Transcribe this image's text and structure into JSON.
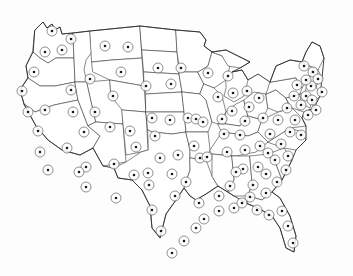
{
  "figure": {
    "kind": "map",
    "title": "",
    "region": "Contiguous United States",
    "projection_hint": "flat outline, state boundaries",
    "background_color": "#fdfdfd",
    "state_fill_color": "#ffffff",
    "state_border_color": "#3a3a3a",
    "nation_border_color": "#2a2a2a",
    "marker": {
      "name": "bullseye-marker",
      "ring_color": "#555555",
      "ring_fill": "#ffffff",
      "core_color": "#1a1a1a",
      "ring_radius_px": 5,
      "core_radius_px": 1.3,
      "count": 115
    },
    "markers": [
      {
        "label": "marker-1",
        "x": 52,
        "y": 31
      },
      {
        "label": "marker-2",
        "x": 45,
        "y": 52
      },
      {
        "label": "marker-3",
        "x": 71,
        "y": 39
      },
      {
        "label": "marker-4",
        "x": 62,
        "y": 50
      },
      {
        "label": "marker-5",
        "x": 34,
        "y": 72
      },
      {
        "label": "marker-6",
        "x": 22,
        "y": 91
      },
      {
        "label": "marker-7",
        "x": 28,
        "y": 112
      },
      {
        "label": "marker-8",
        "x": 45,
        "y": 110
      },
      {
        "label": "marker-9",
        "x": 38,
        "y": 131
      },
      {
        "label": "marker-10",
        "x": 40,
        "y": 152
      },
      {
        "label": "marker-11",
        "x": 48,
        "y": 170
      },
      {
        "label": "marker-12",
        "x": 67,
        "y": 148
      },
      {
        "label": "marker-13",
        "x": 71,
        "y": 90
      },
      {
        "label": "marker-14",
        "x": 73,
        "y": 112
      },
      {
        "label": "marker-15",
        "x": 84,
        "y": 132
      },
      {
        "label": "marker-16",
        "x": 86,
        "y": 167
      },
      {
        "label": "marker-17",
        "x": 79,
        "y": 172
      },
      {
        "label": "marker-18",
        "x": 86,
        "y": 187
      },
      {
        "label": "marker-19",
        "x": 105,
        "y": 46
      },
      {
        "label": "marker-20",
        "x": 121,
        "y": 72
      },
      {
        "label": "marker-21",
        "x": 90,
        "y": 79
      },
      {
        "label": "marker-22",
        "x": 95,
        "y": 112
      },
      {
        "label": "marker-23",
        "x": 110,
        "y": 127
      },
      {
        "label": "marker-24",
        "x": 114,
        "y": 164
      },
      {
        "label": "marker-25",
        "x": 128,
        "y": 47
      },
      {
        "label": "marker-26",
        "x": 113,
        "y": 96
      },
      {
        "label": "marker-27",
        "x": 130,
        "y": 131
      },
      {
        "label": "marker-28",
        "x": 116,
        "y": 198
      },
      {
        "label": "marker-29",
        "x": 136,
        "y": 147
      },
      {
        "label": "marker-30",
        "x": 134,
        "y": 175
      },
      {
        "label": "marker-31",
        "x": 146,
        "y": 86
      },
      {
        "label": "marker-32",
        "x": 158,
        "y": 68
      },
      {
        "label": "marker-33",
        "x": 171,
        "y": 84
      },
      {
        "label": "marker-34",
        "x": 181,
        "y": 68
      },
      {
        "label": "marker-35",
        "x": 152,
        "y": 118
      },
      {
        "label": "marker-36",
        "x": 170,
        "y": 120
      },
      {
        "label": "marker-37",
        "x": 188,
        "y": 118
      },
      {
        "label": "marker-38",
        "x": 196,
        "y": 119
      },
      {
        "label": "marker-39",
        "x": 155,
        "y": 136
      },
      {
        "label": "marker-40",
        "x": 160,
        "y": 158
      },
      {
        "label": "marker-41",
        "x": 178,
        "y": 155
      },
      {
        "label": "marker-42",
        "x": 194,
        "y": 146
      },
      {
        "label": "marker-43",
        "x": 200,
        "y": 158
      },
      {
        "label": "marker-44",
        "x": 148,
        "y": 173
      },
      {
        "label": "marker-45",
        "x": 172,
        "y": 174
      },
      {
        "label": "marker-46",
        "x": 149,
        "y": 185
      },
      {
        "label": "marker-47",
        "x": 152,
        "y": 210
      },
      {
        "label": "marker-48",
        "x": 161,
        "y": 231
      },
      {
        "label": "marker-49",
        "x": 175,
        "y": 196
      },
      {
        "label": "marker-50",
        "x": 186,
        "y": 182
      },
      {
        "label": "marker-51",
        "x": 199,
        "y": 203
      },
      {
        "label": "marker-52",
        "x": 203,
        "y": 122
      },
      {
        "label": "marker-53",
        "x": 222,
        "y": 119
      },
      {
        "label": "marker-54",
        "x": 208,
        "y": 73
      },
      {
        "label": "marker-55",
        "x": 228,
        "y": 76
      },
      {
        "label": "marker-56",
        "x": 218,
        "y": 97
      },
      {
        "label": "marker-57",
        "x": 233,
        "y": 93
      },
      {
        "label": "marker-58",
        "x": 247,
        "y": 91
      },
      {
        "label": "marker-59",
        "x": 232,
        "y": 111
      },
      {
        "label": "marker-60",
        "x": 249,
        "y": 107
      },
      {
        "label": "marker-61",
        "x": 259,
        "y": 98
      },
      {
        "label": "marker-62",
        "x": 245,
        "y": 121
      },
      {
        "label": "marker-63",
        "x": 263,
        "y": 118
      },
      {
        "label": "marker-64",
        "x": 224,
        "y": 134
      },
      {
        "label": "marker-65",
        "x": 240,
        "y": 135
      },
      {
        "label": "marker-66",
        "x": 207,
        "y": 157
      },
      {
        "label": "marker-67",
        "x": 227,
        "y": 152
      },
      {
        "label": "marker-68",
        "x": 245,
        "y": 150
      },
      {
        "label": "marker-69",
        "x": 260,
        "y": 146
      },
      {
        "label": "marker-70",
        "x": 243,
        "y": 169
      },
      {
        "label": "marker-71",
        "x": 258,
        "y": 167
      },
      {
        "label": "marker-72",
        "x": 219,
        "y": 196
      },
      {
        "label": "marker-73",
        "x": 230,
        "y": 186
      },
      {
        "label": "marker-74",
        "x": 236,
        "y": 172
      },
      {
        "label": "marker-75",
        "x": 253,
        "y": 185
      },
      {
        "label": "marker-76",
        "x": 266,
        "y": 174
      },
      {
        "label": "marker-77",
        "x": 275,
        "y": 160
      },
      {
        "label": "marker-78",
        "x": 281,
        "y": 144
      },
      {
        "label": "marker-79",
        "x": 288,
        "y": 156
      },
      {
        "label": "marker-80",
        "x": 270,
        "y": 134
      },
      {
        "label": "marker-81",
        "x": 278,
        "y": 120
      },
      {
        "label": "marker-82",
        "x": 287,
        "y": 108
      },
      {
        "label": "marker-83",
        "x": 295,
        "y": 120
      },
      {
        "label": "marker-84",
        "x": 301,
        "y": 135
      },
      {
        "label": "marker-85",
        "x": 294,
        "y": 96
      },
      {
        "label": "marker-86",
        "x": 301,
        "y": 105
      },
      {
        "label": "marker-87",
        "x": 306,
        "y": 96
      },
      {
        "label": "marker-88",
        "x": 311,
        "y": 86
      },
      {
        "label": "marker-89",
        "x": 306,
        "y": 80
      },
      {
        "label": "marker-90",
        "x": 297,
        "y": 85
      },
      {
        "label": "marker-91",
        "x": 313,
        "y": 72
      },
      {
        "label": "marker-92",
        "x": 304,
        "y": 66
      },
      {
        "label": "marker-93",
        "x": 318,
        "y": 79
      },
      {
        "label": "marker-94",
        "x": 322,
        "y": 92
      },
      {
        "label": "marker-95",
        "x": 312,
        "y": 100
      },
      {
        "label": "marker-96",
        "x": 316,
        "y": 110
      },
      {
        "label": "marker-97",
        "x": 308,
        "y": 115
      },
      {
        "label": "marker-98",
        "x": 290,
        "y": 132
      },
      {
        "label": "marker-99",
        "x": 268,
        "y": 153
      },
      {
        "label": "marker-100",
        "x": 250,
        "y": 197
      },
      {
        "label": "marker-101",
        "x": 266,
        "y": 193
      },
      {
        "label": "marker-102",
        "x": 277,
        "y": 182
      },
      {
        "label": "marker-103",
        "x": 286,
        "y": 170
      },
      {
        "label": "marker-104",
        "x": 269,
        "y": 215
      },
      {
        "label": "marker-105",
        "x": 282,
        "y": 211
      },
      {
        "label": "marker-106",
        "x": 288,
        "y": 226
      },
      {
        "label": "marker-107",
        "x": 293,
        "y": 243
      },
      {
        "label": "marker-108",
        "x": 219,
        "y": 211
      },
      {
        "label": "marker-109",
        "x": 204,
        "y": 219
      },
      {
        "label": "marker-110",
        "x": 196,
        "y": 228
      },
      {
        "label": "marker-111",
        "x": 184,
        "y": 241
      },
      {
        "label": "marker-112",
        "x": 172,
        "y": 253
      },
      {
        "label": "marker-113",
        "x": 234,
        "y": 208
      },
      {
        "label": "marker-114",
        "x": 242,
        "y": 203
      },
      {
        "label": "marker-115",
        "x": 257,
        "y": 210
      }
    ]
  }
}
